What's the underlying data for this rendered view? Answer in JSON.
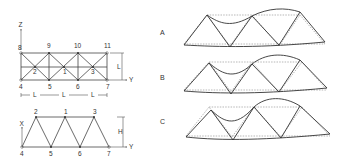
{
  "top_truss": {
    "axis_z": "Z",
    "axis_y": "Y",
    "dim_height": "L",
    "dim_spans": [
      "L",
      "L",
      "L"
    ],
    "nodes": {
      "n8": "8",
      "n9": "9",
      "n10": "10",
      "n11": "11",
      "n4": "4",
      "n5": "5",
      "n6": "6",
      "n7": "7",
      "n2": "2",
      "n1": "1",
      "n3": "3"
    }
  },
  "side_truss": {
    "axis_x": "X",
    "axis_y": "Y",
    "dim_height": "H",
    "nodes": {
      "n2": "2",
      "n1": "1",
      "n3": "3",
      "n4": "4",
      "n5": "5",
      "n6": "6",
      "n7": "7"
    }
  },
  "mode_shapes": {
    "labels": [
      "A",
      "B",
      "C"
    ]
  }
}
